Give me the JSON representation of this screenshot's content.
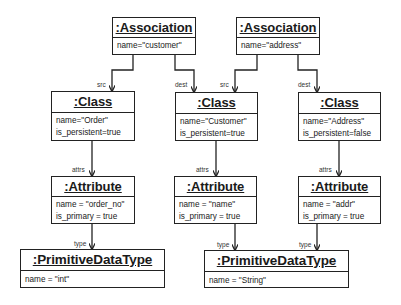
{
  "diagram": {
    "type": "UML object diagram",
    "associations": [
      {
        "id": "assoc1",
        "title": ":Association",
        "attrs": [
          "name=\"customer\""
        ]
      },
      {
        "id": "assoc2",
        "title": ":Association",
        "attrs": [
          "name=\"address\""
        ]
      }
    ],
    "classes": [
      {
        "id": "class_order",
        "title": ":Class",
        "attrs": [
          "name=\"Order\"",
          "is_persistent=true"
        ]
      },
      {
        "id": "class_customer",
        "title": ":Class",
        "attrs": [
          "name=\"Customer\"",
          "is_persistent=true"
        ]
      },
      {
        "id": "class_address",
        "title": ":Class",
        "attrs": [
          "name=\"Address\"",
          "is_persistent=false"
        ]
      }
    ],
    "attributes": [
      {
        "id": "attr_order_no",
        "title": ":Attribute",
        "attrs": [
          "name = \"order_no\"",
          "is_primary = true"
        ]
      },
      {
        "id": "attr_name",
        "title": ":Attribute",
        "attrs": [
          "name = \"name\"",
          "is_primary = true"
        ]
      },
      {
        "id": "attr_addr",
        "title": ":Attribute",
        "attrs": [
          "name = \"addr\"",
          "is_primary = true"
        ]
      }
    ],
    "primitive_types": [
      {
        "id": "pdt_int",
        "title": ":PrimitiveDataType",
        "attrs": [
          "name = \"int\""
        ]
      },
      {
        "id": "pdt_string",
        "title": ":PrimitiveDataType",
        "attrs": [
          "name = \"String\""
        ]
      }
    ],
    "edge_labels": {
      "src": "src",
      "dest": "dest",
      "attrs": "attrs",
      "type": "type"
    },
    "edges": [
      {
        "from": "assoc1",
        "to": "class_order",
        "label": "src"
      },
      {
        "from": "assoc1",
        "to": "class_customer",
        "label": "dest"
      },
      {
        "from": "assoc2",
        "to": "class_customer",
        "label": "src"
      },
      {
        "from": "assoc2",
        "to": "class_address",
        "label": "dest"
      },
      {
        "from": "class_order",
        "to": "attr_order_no",
        "label": "attrs"
      },
      {
        "from": "class_customer",
        "to": "attr_name",
        "label": "attrs"
      },
      {
        "from": "class_address",
        "to": "attr_addr",
        "label": "attrs"
      },
      {
        "from": "attr_order_no",
        "to": "pdt_int",
        "label": "type"
      },
      {
        "from": "attr_name",
        "to": "pdt_string",
        "label": "type"
      },
      {
        "from": "attr_addr",
        "to": "pdt_string",
        "label": "type"
      }
    ]
  }
}
